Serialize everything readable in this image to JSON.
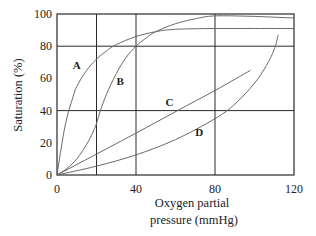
{
  "chart_data": {
    "type": "line",
    "title": "",
    "xlabel_lines": [
      "Oxygen partial",
      "pressure (mmHg)"
    ],
    "ylabel": "Saturation (%)",
    "xlim": [
      0,
      120
    ],
    "ylim": [
      0,
      100
    ],
    "x_ticks": [
      0,
      40,
      80,
      120
    ],
    "y_ticks": [
      0,
      20,
      40,
      60,
      80,
      100
    ],
    "grid": {
      "vertical_lines_at": [
        20,
        40,
        80
      ],
      "horizontal_lines_at": [
        40,
        80
      ]
    },
    "legend": "inline curve labels",
    "series": [
      {
        "name": "A",
        "label_pos": [
          10,
          66
        ],
        "points": [
          [
            0,
            0
          ],
          [
            2,
            16
          ],
          [
            4,
            30
          ],
          [
            6,
            40
          ],
          [
            8,
            48
          ],
          [
            10,
            55
          ],
          [
            15,
            65
          ],
          [
            20,
            72
          ],
          [
            25,
            77
          ],
          [
            30,
            81
          ],
          [
            40,
            86
          ],
          [
            50,
            89
          ],
          [
            60,
            90.5
          ],
          [
            80,
            91
          ],
          [
            100,
            91
          ],
          [
            120,
            91
          ]
        ]
      },
      {
        "name": "B",
        "label_pos": [
          32,
          56
        ],
        "points": [
          [
            0,
            0
          ],
          [
            5,
            4
          ],
          [
            10,
            10
          ],
          [
            15,
            19
          ],
          [
            18,
            26
          ],
          [
            20,
            32
          ],
          [
            22,
            40
          ],
          [
            25,
            50
          ],
          [
            30,
            63
          ],
          [
            35,
            73
          ],
          [
            40,
            80
          ],
          [
            45,
            85
          ],
          [
            50,
            89
          ],
          [
            60,
            94
          ],
          [
            70,
            97
          ],
          [
            80,
            98.8
          ],
          [
            100,
            98.5
          ],
          [
            120,
            97.5
          ]
        ]
      },
      {
        "name": "C",
        "label_pos": [
          57,
          43
        ],
        "points": [
          [
            0,
            0
          ],
          [
            20,
            13
          ],
          [
            40,
            26
          ],
          [
            61,
            40
          ],
          [
            80,
            52.5
          ],
          [
            98,
            65
          ]
        ]
      },
      {
        "name": "D",
        "label_pos": [
          72,
          24
        ],
        "points": [
          [
            0,
            0
          ],
          [
            20,
            5.5
          ],
          [
            40,
            12.5
          ],
          [
            60,
            22
          ],
          [
            80,
            35
          ],
          [
            90,
            44
          ],
          [
            100,
            57
          ],
          [
            106,
            68
          ],
          [
            110,
            78
          ],
          [
            112,
            87
          ]
        ]
      }
    ]
  }
}
